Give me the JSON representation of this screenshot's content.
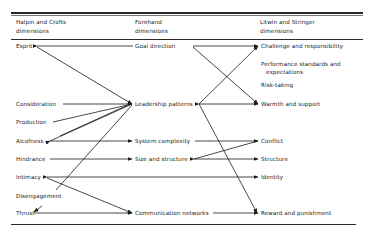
{
  "headers": {
    "col1": [
      "Halpin and Crofts",
      "dimensions"
    ],
    "col2": [
      "Forehand",
      "dimensions"
    ],
    "col3": [
      "Litwin and Stringer",
      "dimensions"
    ]
  },
  "col1_items": [
    {
      "label": "Esprit",
      "y": 46
    },
    {
      "label": "Consideration",
      "y": 104
    },
    {
      "label": "Production",
      "y": 122
    },
    {
      "label": "Alcofness",
      "y": 141
    },
    {
      "label": "Hindrance",
      "y": 159
    },
    {
      "label": "Intimacy",
      "y": 177
    },
    {
      "label": "Disengagement",
      "y": 196
    },
    {
      "label": "Thrust",
      "y": 213
    }
  ],
  "col2_items": [
    {
      "label": "Goal direction",
      "y": 46
    },
    {
      "label": "Leadership patterns",
      "y": 104
    },
    {
      "label": "System complexity",
      "y": 141
    },
    {
      "label": "Size and structure",
      "y": 159
    },
    {
      "label": "Communication networks",
      "y": 213
    }
  ],
  "col3_items": [
    {
      "label": "Challenge and responsibility",
      "y": 46
    },
    {
      "label": "Performance standards and",
      "y": 64
    },
    {
      "label": "expectations",
      "y": 72
    },
    {
      "label": "Risk-taking",
      "y": 85
    },
    {
      "label": "Warmth and support",
      "y": 104
    },
    {
      "label": "Conflict",
      "y": 141
    },
    {
      "label": "Structure",
      "y": 159
    },
    {
      "label": "Identity",
      "y": 177
    },
    {
      "label": "Reward and punishment",
      "y": 213
    }
  ],
  "connections": [
    {
      "from": "Esprit",
      "to": "Goal direction"
    },
    {
      "from": "Esprit",
      "to": "Leadership patterns"
    },
    {
      "from": "Consideration",
      "to": "Leadership patterns"
    },
    {
      "from": "Production",
      "to": "Leadership patterns"
    },
    {
      "from": "Alcofness",
      "to": "Leadership patterns"
    },
    {
      "from": "Alcofness",
      "to": "System complexity"
    },
    {
      "from": "Hindrance",
      "to": "Size and structure"
    },
    {
      "from": "Intimacy",
      "to": "Identity"
    },
    {
      "from": "Intimacy",
      "to": "Communication networks"
    },
    {
      "from": "Leadership patterns",
      "to": "Disengagement"
    },
    {
      "from": "Thrust",
      "to": "Communication networks"
    },
    {
      "from": "Goal direction",
      "to": "Challenge and responsibility"
    },
    {
      "from": "Goal direction",
      "to": "Warmth and support"
    },
    {
      "from": "Leadership patterns",
      "to": "Challenge and responsibility"
    },
    {
      "from": "Leadership patterns",
      "to": "Warmth and support"
    },
    {
      "from": "Leadership patterns",
      "to": "Reward and punishment"
    },
    {
      "from": "System complexity",
      "to": "Conflict"
    },
    {
      "from": "Size and structure",
      "to": "Conflict"
    },
    {
      "from": "Size and structure",
      "to": "Structure"
    },
    {
      "from": "Communication networks",
      "to": "Reward and punishment"
    }
  ],
  "colors": {
    "ink": "#1a1a1a",
    "background": "#ffffff"
  }
}
